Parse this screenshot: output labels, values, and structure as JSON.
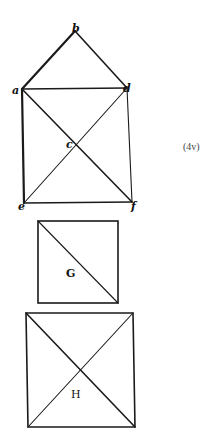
{
  "figure": {
    "page_ref": "(4v)",
    "page_ref_pos": [
      183,
      150
    ],
    "ink_color": "#1a1a1a"
  },
  "house_figure": {
    "points": {
      "a": [
        22,
        89
      ],
      "b": [
        75,
        31
      ],
      "d": [
        127,
        88
      ],
      "c": [
        77,
        145
      ],
      "e": [
        24,
        203
      ],
      "f": [
        132,
        202
      ]
    },
    "labels": [
      {
        "text": "b",
        "x": 72,
        "y": 32
      },
      {
        "text": "a",
        "x": 12,
        "y": 94
      },
      {
        "text": "d",
        "x": 123,
        "y": 92
      },
      {
        "text": "c",
        "x": 66,
        "y": 148
      },
      {
        "text": "e",
        "x": 18,
        "y": 210
      },
      {
        "text": "f",
        "x": 131,
        "y": 210
      }
    ]
  },
  "square_g": {
    "label": "G",
    "top_left": [
      38,
      221
    ],
    "bottom_right": [
      118,
      303
    ],
    "label_pos": [
      66,
      277
    ]
  },
  "square_h": {
    "label": "H",
    "top_left": [
      26,
      313
    ],
    "top_right": [
      133,
      313
    ],
    "bottom_left": [
      28,
      427
    ],
    "bottom_right": [
      135,
      427
    ],
    "label_pos": [
      71,
      398
    ]
  }
}
